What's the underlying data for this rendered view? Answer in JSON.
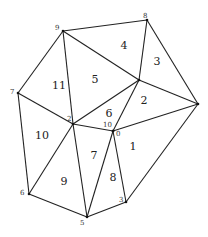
{
  "diagram": {
    "type": "triangulation",
    "vertices": [
      {
        "id": "9",
        "label": "9",
        "x": 63,
        "y": 31,
        "lx": 55,
        "ly": 30
      },
      {
        "id": "8",
        "label": "8",
        "x": 147,
        "y": 20,
        "lx": 143,
        "ly": 18
      },
      {
        "id": "7",
        "label": "7",
        "x": 18,
        "y": 93,
        "lx": 10,
        "ly": 94
      },
      {
        "id": "2",
        "label": "2",
        "x": 73,
        "y": 124,
        "lx": 67,
        "ly": 121
      },
      {
        "id": "10",
        "label": "10",
        "x": 113,
        "y": 131,
        "lx": 103,
        "ly": 127
      },
      {
        "id": "0",
        "label": "0",
        "x": 113,
        "y": 131,
        "lx": 116,
        "ly": 136
      },
      {
        "id": "c",
        "label": "",
        "x": 139,
        "y": 80,
        "lx": 0,
        "ly": 0
      },
      {
        "id": "r",
        "label": "",
        "x": 198,
        "y": 104,
        "lx": 0,
        "ly": 0
      },
      {
        "id": "6",
        "label": "6",
        "x": 29,
        "y": 194,
        "lx": 20,
        "ly": 195
      },
      {
        "id": "5",
        "label": "5",
        "x": 87,
        "y": 217,
        "lx": 80,
        "ly": 225
      },
      {
        "id": "3",
        "label": "3",
        "x": 126,
        "y": 202,
        "lx": 119,
        "ly": 202
      }
    ],
    "edges": [
      [
        63,
        31,
        147,
        20
      ],
      [
        147,
        20,
        198,
        104
      ],
      [
        63,
        31,
        18,
        93
      ],
      [
        18,
        93,
        29,
        194
      ],
      [
        29,
        194,
        87,
        217
      ],
      [
        87,
        217,
        126,
        202
      ],
      [
        126,
        202,
        198,
        104
      ],
      [
        63,
        31,
        73,
        124
      ],
      [
        63,
        31,
        139,
        80
      ],
      [
        147,
        20,
        139,
        80
      ],
      [
        139,
        80,
        198,
        104
      ],
      [
        139,
        80,
        73,
        124
      ],
      [
        139,
        80,
        113,
        131
      ],
      [
        73,
        124,
        113,
        131
      ],
      [
        113,
        131,
        198,
        104
      ],
      [
        18,
        93,
        73,
        124
      ],
      [
        73,
        124,
        29,
        194
      ],
      [
        73,
        124,
        87,
        217
      ],
      [
        113,
        131,
        87,
        217
      ],
      [
        113,
        131,
        126,
        202
      ]
    ],
    "faces": [
      {
        "label": "1",
        "x": 133,
        "y": 150
      },
      {
        "label": "2",
        "x": 144,
        "y": 104
      },
      {
        "label": "3",
        "x": 157,
        "y": 65
      },
      {
        "label": "4",
        "x": 124,
        "y": 49
      },
      {
        "label": "5",
        "x": 95,
        "y": 83
      },
      {
        "label": "6",
        "x": 109,
        "y": 117
      },
      {
        "label": "7",
        "x": 94,
        "y": 159
      },
      {
        "label": "8",
        "x": 113,
        "y": 181
      },
      {
        "label": "9",
        "x": 64,
        "y": 185
      },
      {
        "label": "10",
        "x": 42,
        "y": 139
      },
      {
        "label": "11",
        "x": 59,
        "y": 89
      }
    ]
  }
}
